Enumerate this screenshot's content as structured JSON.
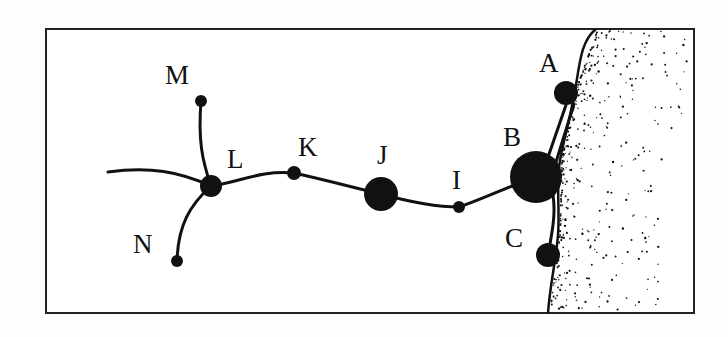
{
  "diagram": {
    "type": "network-map",
    "frame": {
      "x": 46,
      "y": 29,
      "width": 648,
      "height": 284,
      "stroke": "#222222"
    },
    "colors": {
      "ink": "#111111",
      "background": "#fdfdfd",
      "sea": "#ffffff"
    },
    "nodes": [
      {
        "id": "A",
        "label": "A",
        "x": 566,
        "y": 93,
        "r": 12,
        "label_x": 539,
        "label_y": 72
      },
      {
        "id": "B",
        "label": "B",
        "x": 536,
        "y": 177,
        "r": 26,
        "label_x": 503,
        "label_y": 146
      },
      {
        "id": "C",
        "label": "C",
        "x": 548,
        "y": 255,
        "r": 12,
        "label_x": 505,
        "label_y": 247
      },
      {
        "id": "I",
        "label": "I",
        "x": 459,
        "y": 207,
        "r": 6,
        "label_x": 452,
        "label_y": 189
      },
      {
        "id": "J",
        "label": "J",
        "x": 381,
        "y": 194,
        "r": 17,
        "label_x": 377,
        "label_y": 164
      },
      {
        "id": "K",
        "label": "K",
        "x": 294,
        "y": 173,
        "r": 7,
        "label_x": 298,
        "label_y": 156
      },
      {
        "id": "L",
        "label": "L",
        "x": 211,
        "y": 186,
        "r": 11,
        "label_x": 227,
        "label_y": 168
      },
      {
        "id": "M",
        "label": "M",
        "x": 201,
        "y": 101,
        "r": 6,
        "label_x": 165,
        "label_y": 84
      },
      {
        "id": "N",
        "label": "N",
        "x": 177,
        "y": 261,
        "r": 6,
        "label_x": 133,
        "label_y": 253
      }
    ],
    "edges": [
      {
        "from": "offmap-west",
        "to": "L",
        "path": "M108,172 C150,166 180,172 211,186"
      },
      {
        "from": "M",
        "to": "L",
        "path": "M201,101 C198,140 202,160 211,186"
      },
      {
        "from": "L",
        "to": "N",
        "path": "M211,186 C190,205 178,225 177,261"
      },
      {
        "from": "L",
        "to": "K",
        "path": "M211,186 C240,182 260,170 294,173"
      },
      {
        "from": "K",
        "to": "J",
        "path": "M294,173 C330,181 355,188 381,194"
      },
      {
        "from": "J",
        "to": "I",
        "path": "M381,194 C410,202 435,207 459,207"
      },
      {
        "from": "I",
        "to": "B",
        "path": "M459,207 C480,200 500,190 536,177"
      },
      {
        "from": "B",
        "to": "A",
        "path": "M547,160 L566,105 M556,162 L574,104"
      },
      {
        "from": "B",
        "to": "C",
        "path": "M553,195 C556,215 552,232 548,255"
      }
    ],
    "coastline": "M596,29 C582,40 580,60 576,85 C572,110 565,135 560,160 C556,185 560,210 558,235 C556,260 550,285 548,313"
  }
}
